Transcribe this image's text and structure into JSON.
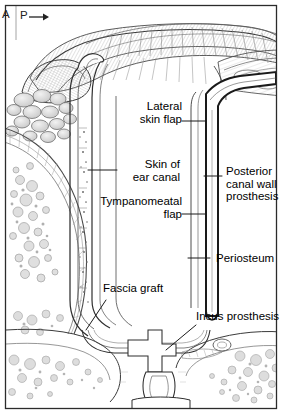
{
  "figure": {
    "type": "medical-anatomical-illustration",
    "style": "pencil-and-ink line drawing with stipple shading",
    "background_color": "#ffffff",
    "ink_color": "#1a1a1a",
    "border_color": "#2b2b2b",
    "panel_letter": "A",
    "orientation_marker": {
      "label": "P",
      "arrow": "→",
      "meaning": "posterior direction",
      "icon": "arrow-right-icon"
    }
  },
  "labels": [
    {
      "id": "lateral-skin-flap",
      "text_lines": [
        "Lateral",
        "skin flap"
      ],
      "align": "right"
    },
    {
      "id": "skin-of-ear-canal",
      "text_lines": [
        "Skin of",
        "ear canal"
      ],
      "align": "right"
    },
    {
      "id": "tympanomeatal-flap",
      "text_lines": [
        "Tympanomeatal",
        "flap"
      ],
      "align": "right"
    },
    {
      "id": "posterior-canal-wall-prosthesis",
      "text_lines": [
        "Posterior",
        "canal wall",
        "prosthesis"
      ],
      "align": "left"
    },
    {
      "id": "periosteum",
      "text_lines": [
        "Periosteum"
      ],
      "align": "left"
    },
    {
      "id": "fascia-graft",
      "text_lines": [
        "Fascia graft"
      ],
      "align": "left"
    },
    {
      "id": "incus-prosthesis",
      "text_lines": [
        "Incus prosthesis"
      ],
      "align": "left"
    }
  ],
  "label_text": {
    "lateral_skin_flap_1": "Lateral",
    "lateral_skin_flap_2": "skin flap",
    "skin_of_ear_canal_1": "Skin of",
    "skin_of_ear_canal_2": "ear canal",
    "tympanomeatal_flap_1": "Tympanomeatal",
    "tympanomeatal_flap_2": "flap",
    "posterior_canal_wall_prosthesis_1": "Posterior",
    "posterior_canal_wall_prosthesis_2": "canal wall",
    "posterior_canal_wall_prosthesis_3": "prosthesis",
    "periosteum": "Periosteum",
    "fascia_graft": "Fascia graft",
    "incus_prosthesis": "Incus prosthesis",
    "panel_letter": "A",
    "orientation_letter": "P",
    "orientation_arrow": "→"
  },
  "anatomy_regions": [
    {
      "id": "auricle-pinna",
      "name": "Auricle / pinna",
      "location": "top"
    },
    {
      "id": "mastoid-air-cells",
      "name": "Mastoid air cells",
      "location": "left"
    },
    {
      "id": "bone-marrow-stipple",
      "name": "Cancellous bone marrow",
      "location": "bottom-left and bottom-right"
    },
    {
      "id": "external-auditory-canal",
      "name": "External auditory canal",
      "location": "center"
    },
    {
      "id": "canal-wall-prosthesis-bar",
      "name": "Posterior canal wall prosthesis",
      "location": "center-right vertical bar"
    },
    {
      "id": "middle-ear-cavity",
      "name": "Middle ear cavity",
      "location": "bottom-center"
    },
    {
      "id": "stapes",
      "name": "Stapes",
      "location": "bottom-center"
    }
  ]
}
